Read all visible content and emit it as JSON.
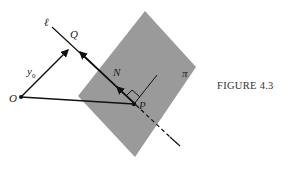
{
  "figure": {
    "caption": "FIGURE 4.3",
    "labels": {
      "line": "ℓ",
      "Q": "Q",
      "y0": "y",
      "y0_sub": "0",
      "N": "N",
      "O": "O",
      "P": "P",
      "plane": "π"
    },
    "colors": {
      "plane": "#9a9a9a",
      "lines": "#111111",
      "background": "#ffffff"
    }
  }
}
